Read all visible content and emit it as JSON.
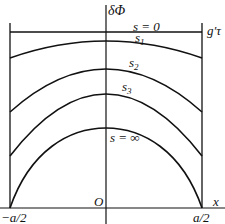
{
  "axes": {
    "y_label": "δΦ",
    "x_label": "x",
    "origin_label": "O",
    "left_tick": "−a/2",
    "right_tick": "a/2",
    "top_right_label": "g′τ"
  },
  "curves": [
    {
      "name": "s = 0",
      "label_base": "s = 0",
      "label_sub": ""
    },
    {
      "name": "s1",
      "label_base": "s",
      "label_sub": "1"
    },
    {
      "name": "s2",
      "label_base": "s",
      "label_sub": "2"
    },
    {
      "name": "s3",
      "label_base": "s",
      "label_sub": "3"
    },
    {
      "name": "s = ∞",
      "label_base": "s = ∞",
      "label_sub": ""
    }
  ],
  "colors": {
    "line": "#111111",
    "background": "#ffffff"
  }
}
